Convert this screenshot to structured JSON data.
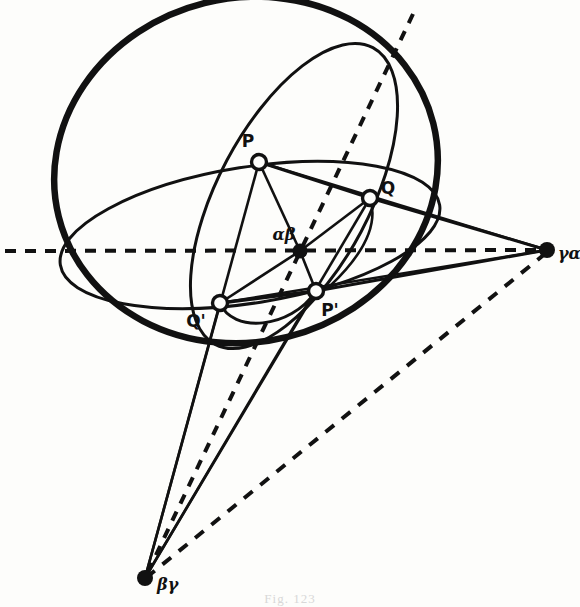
{
  "figure": {
    "kind": "geometric-line-drawing",
    "background_color": "#fdfdfb",
    "ink_color": "#111111",
    "caption": "Fig. 123"
  },
  "labels": {
    "p": "P",
    "q": "Q",
    "p_prime": "P'",
    "q_prime": "Q'",
    "alpha_beta": "αβ",
    "gamma_alpha": "γα",
    "beta_gamma": "βγ"
  },
  "points": [
    {
      "name": "P",
      "label": "P",
      "x": 259,
      "y": 162,
      "marker": "open-circle"
    },
    {
      "name": "Q",
      "label": "Q",
      "x": 370,
      "y": 198,
      "marker": "open-circle"
    },
    {
      "name": "Q'",
      "label": "Q'",
      "x": 220,
      "y": 303,
      "marker": "open-circle"
    },
    {
      "name": "P'",
      "label": "P'",
      "x": 316,
      "y": 291,
      "marker": "open-circle"
    },
    {
      "name": "ab",
      "label": "αβ",
      "x": 300,
      "y": 251,
      "marker": "filled-dot"
    },
    {
      "name": "ga",
      "label": "γα",
      "x": 547,
      "y": 250,
      "marker": "filled-dot"
    },
    {
      "name": "bg",
      "label": "βγ",
      "x": 145,
      "y": 578,
      "marker": "filled-dot"
    }
  ],
  "label_offsets": [
    {
      "name": "P",
      "x": 248,
      "y": 147
    },
    {
      "name": "Q",
      "x": 383,
      "y": 192
    },
    {
      "name": "Q'",
      "x": 192,
      "y": 324
    },
    {
      "name": "P'",
      "x": 325,
      "y": 313
    },
    {
      "name": "ab",
      "x": 271,
      "y": 240
    },
    {
      "name": "ga",
      "x": 558,
      "y": 258
    },
    {
      "name": "bg",
      "x": 157,
      "y": 588
    }
  ],
  "curves": {
    "sphere_outline": "thick ellipse, center (246,170), rx 193, ry 172, rotated -12deg",
    "horizontal_great_circle": "flat ellipse through equator",
    "tilted_great_circle": "steep ellipse through P, Q, P', Q'",
    "small_arc": "near-side arc from Q' to P'"
  },
  "lines": {
    "dashed_axis_label": "horizontal dashed axis through αβ to γα",
    "dashed_diagonal_label": "dashed diagonal through αβ toward βγ",
    "dashed_long_label": "dashed line from γα to βγ"
  }
}
